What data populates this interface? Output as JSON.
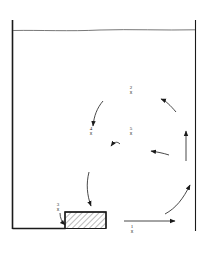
{
  "diagram": {
    "colors": {
      "ink": "#1a1a1a",
      "water_line": "#555555",
      "background": "#ffffff"
    },
    "points": [
      {
        "id": "p1",
        "number": "1",
        "marker": "x"
      },
      {
        "id": "p2",
        "number": "2",
        "marker": "x"
      },
      {
        "id": "p3",
        "number": "3",
        "marker": "x"
      },
      {
        "id": "p4",
        "number": "4",
        "marker": "x"
      },
      {
        "id": "p5",
        "number": "5",
        "marker": "x"
      }
    ]
  }
}
